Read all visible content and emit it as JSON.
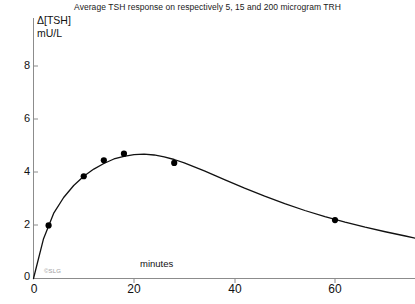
{
  "chart_data": {
    "type": "line",
    "title": "Average TSH response on respectively 5, 15 and 200 microgram TRH",
    "xlabel": "minutes",
    "ylabel": "Δ[TSH]",
    "ylabel_units": "mU/L",
    "xlim": [
      0,
      76
    ],
    "ylim": [
      0,
      8.6
    ],
    "xticks": [
      0,
      20,
      40,
      60
    ],
    "yticks": [
      0,
      2,
      4,
      6,
      8
    ],
    "xtick_labels": [
      "0",
      "20",
      "40",
      "60"
    ],
    "ytick_labels": [
      "0",
      "2",
      "4",
      "6",
      "8"
    ],
    "grid": false,
    "legend": "none",
    "marker": "filled-circle",
    "series": [
      {
        "name": "Average TSH response",
        "x": [
          3,
          10,
          14,
          18,
          28,
          60
        ],
        "values": [
          2.0,
          3.85,
          4.45,
          4.7,
          4.35,
          2.2
        ]
      }
    ],
    "fitted_curve": {
      "name": "smoothed response curve",
      "x": [
        0,
        2,
        4,
        6,
        8,
        10,
        12,
        14,
        16,
        18,
        20,
        22,
        24,
        26,
        28,
        30,
        34,
        38,
        42,
        46,
        50,
        54,
        58,
        62,
        66,
        70,
        74,
        76
      ],
      "values": [
        0,
        1.5,
        2.45,
        3.05,
        3.5,
        3.85,
        4.12,
        4.33,
        4.5,
        4.6,
        4.66,
        4.68,
        4.65,
        4.58,
        4.48,
        4.35,
        4.05,
        3.72,
        3.4,
        3.1,
        2.82,
        2.56,
        2.33,
        2.12,
        1.93,
        1.76,
        1.6,
        1.52
      ]
    },
    "annotations": [
      {
        "name": "watermark",
        "text": "©SLG"
      }
    ]
  },
  "axes": {
    "y_axis_label_line1": "Δ[TSH]",
    "y_axis_label_line2": "mU/L",
    "x_axis_label": "minutes"
  },
  "colors": {
    "line": "#111111",
    "marker": "#000000",
    "axis": "#8c8c8c",
    "text": "#111111",
    "title": "#1a1a1a",
    "watermark": "#9a9a9a",
    "background": "#ffffff"
  }
}
